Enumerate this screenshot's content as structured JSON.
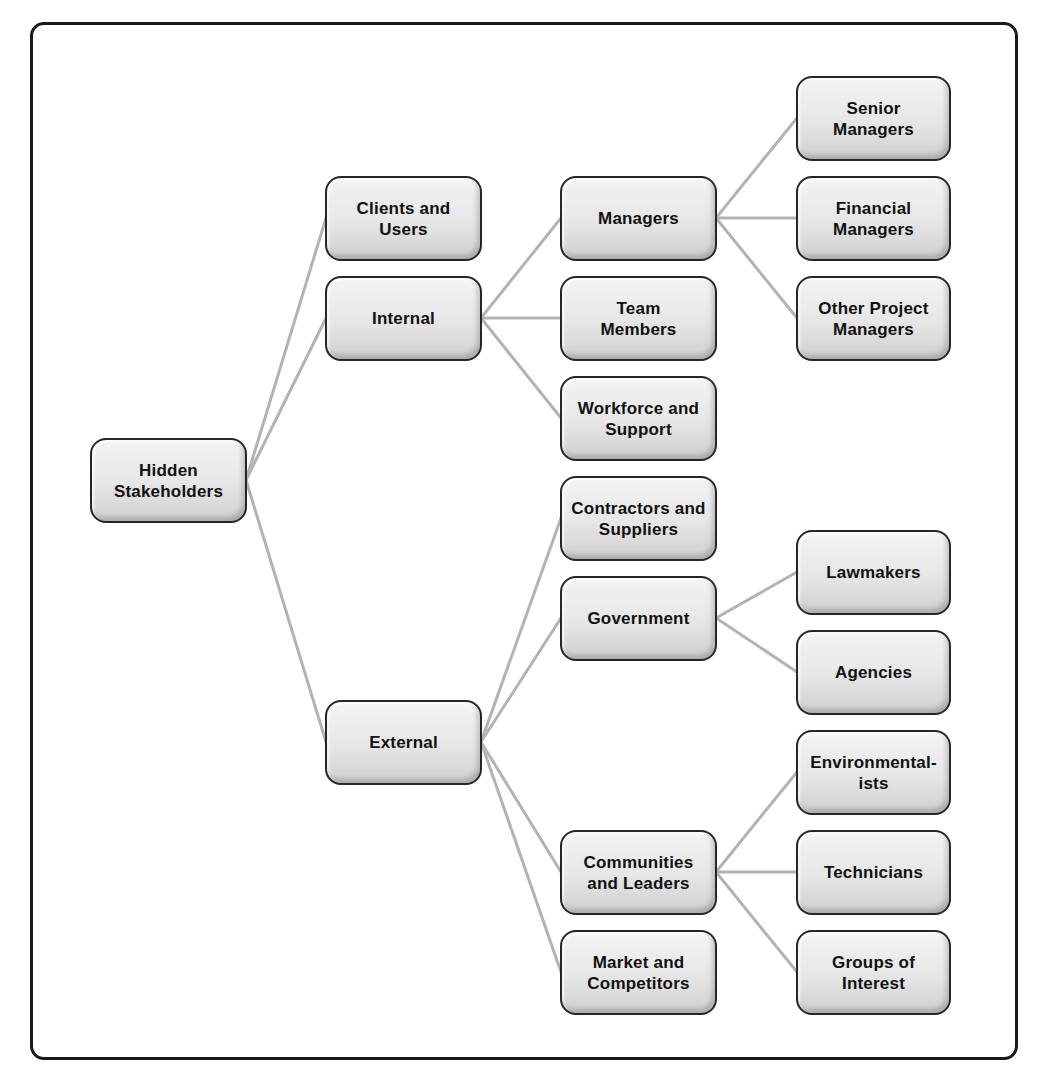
{
  "diagram": {
    "title": "Hidden Stakeholders",
    "root": "Hidden Stakeholders",
    "nodes": {
      "root": "Hidden Stakeholders",
      "clients": "Clients and Users",
      "internal": "Internal",
      "external": "External",
      "managers": "Managers",
      "team": "Team Members",
      "workforce": "Workforce and Support",
      "contractors": "Contractors and Suppliers",
      "government": "Government",
      "communities": "Communities and Leaders",
      "market": "Market and Competitors",
      "senior": "Senior Managers",
      "financial": "Financial Managers",
      "otherpm": "Other Project Managers",
      "lawmakers": "Lawmakers",
      "agencies": "Agencies",
      "environmental": "Environmental-ists",
      "technicians": "Technicians",
      "groups": "Groups of Interest"
    },
    "edges": [
      [
        "Hidden Stakeholders",
        "Clients and Users"
      ],
      [
        "Hidden Stakeholders",
        "Internal"
      ],
      [
        "Hidden Stakeholders",
        "External"
      ],
      [
        "Internal",
        "Managers"
      ],
      [
        "Internal",
        "Team Members"
      ],
      [
        "Internal",
        "Workforce and Support"
      ],
      [
        "Managers",
        "Senior Managers"
      ],
      [
        "Managers",
        "Financial Managers"
      ],
      [
        "Managers",
        "Other Project Managers"
      ],
      [
        "External",
        "Contractors and Suppliers"
      ],
      [
        "External",
        "Government"
      ],
      [
        "External",
        "Communities and Leaders"
      ],
      [
        "External",
        "Market and Competitors"
      ],
      [
        "Government",
        "Lawmakers"
      ],
      [
        "Government",
        "Agencies"
      ],
      [
        "Communities and Leaders",
        "Environmental-ists"
      ],
      [
        "Communities and Leaders",
        "Technicians"
      ],
      [
        "Communities and Leaders",
        "Groups of Interest"
      ]
    ],
    "colors": {
      "line": "#b3b3b3",
      "border": "#262626",
      "fill_top": "#f4f4f4",
      "fill_bottom": "#cfcfcf",
      "text": "#111111"
    }
  }
}
